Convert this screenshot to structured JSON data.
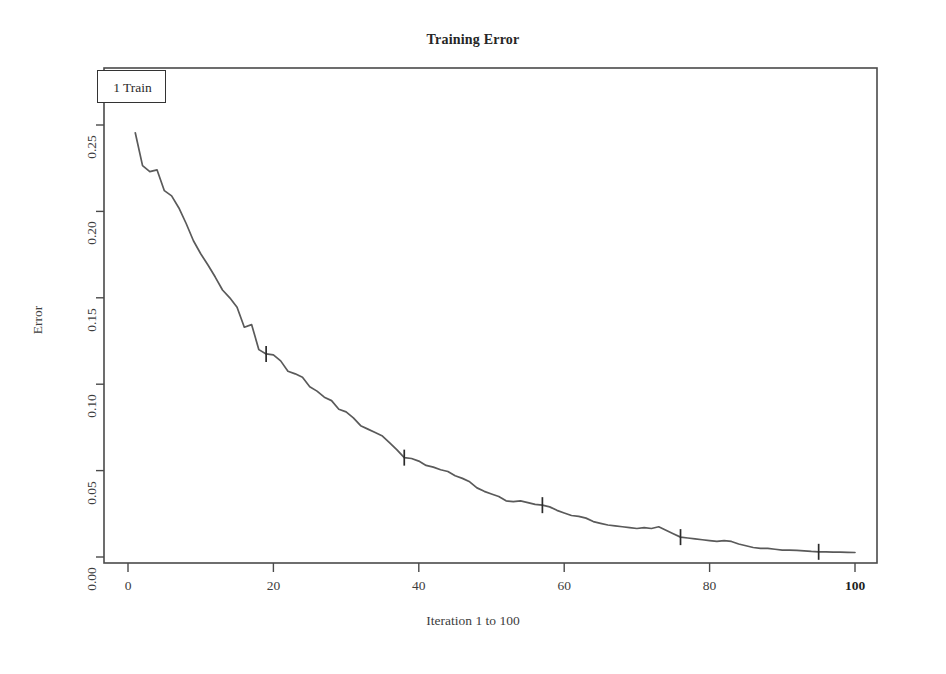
{
  "chart_data": {
    "type": "line",
    "title": "Training Error",
    "xlabel": "Iteration 1 to 100",
    "ylabel": "Error",
    "xlim": [
      0,
      100
    ],
    "ylim": [
      0.0,
      0.26
    ],
    "grid": false,
    "legend_position": "top-left",
    "legend": [
      "1 Train"
    ],
    "xticks": [
      0,
      20,
      40,
      60,
      80,
      100
    ],
    "xtick_labels": [
      "0",
      "20",
      "40",
      "60",
      "80",
      "100"
    ],
    "yticks": [
      0.0,
      0.05,
      0.1,
      0.15,
      0.2,
      0.25
    ],
    "ytick_labels": [
      "0.00",
      "0.05",
      "0.10",
      "0.15",
      "0.20",
      "0.25"
    ],
    "line_color": "#5a5a5a",
    "series": [
      {
        "name": "1 Train",
        "marker_iterations": [
          19,
          38,
          57,
          76,
          95
        ],
        "x": [
          1,
          2,
          3,
          4,
          5,
          6,
          7,
          8,
          9,
          10,
          11,
          12,
          13,
          14,
          15,
          16,
          17,
          18,
          19,
          20,
          21,
          22,
          23,
          24,
          25,
          26,
          27,
          28,
          29,
          30,
          31,
          32,
          33,
          34,
          35,
          36,
          37,
          38,
          39,
          40,
          41,
          42,
          43,
          44,
          45,
          46,
          47,
          48,
          49,
          50,
          51,
          52,
          53,
          54,
          55,
          56,
          57,
          58,
          59,
          60,
          61,
          62,
          63,
          64,
          65,
          66,
          67,
          68,
          69,
          70,
          71,
          72,
          73,
          74,
          75,
          76,
          77,
          78,
          79,
          80,
          81,
          82,
          83,
          84,
          85,
          86,
          87,
          88,
          89,
          90,
          91,
          92,
          93,
          94,
          95,
          96,
          97,
          98,
          99,
          100
        ],
        "values": [
          0.2455,
          0.2265,
          0.223,
          0.224,
          0.212,
          0.209,
          0.202,
          0.193,
          0.183,
          0.1755,
          0.169,
          0.162,
          0.1545,
          0.15,
          0.1445,
          0.133,
          0.1345,
          0.12,
          0.1175,
          0.117,
          0.1135,
          0.1075,
          0.106,
          0.104,
          0.0985,
          0.096,
          0.0925,
          0.0905,
          0.0855,
          0.084,
          0.0805,
          0.076,
          0.074,
          0.072,
          0.07,
          0.066,
          0.062,
          0.0575,
          0.057,
          0.0555,
          0.053,
          0.052,
          0.0505,
          0.0495,
          0.047,
          0.0455,
          0.0435,
          0.04,
          0.038,
          0.0365,
          0.035,
          0.0325,
          0.032,
          0.0325,
          0.0315,
          0.0305,
          0.03,
          0.029,
          0.027,
          0.0255,
          0.024,
          0.0235,
          0.0225,
          0.0205,
          0.0195,
          0.0185,
          0.018,
          0.0175,
          0.017,
          0.0165,
          0.017,
          0.0165,
          0.0175,
          0.0155,
          0.0135,
          0.0115,
          0.011,
          0.0105,
          0.01,
          0.0095,
          0.009,
          0.0095,
          0.009,
          0.0075,
          0.0065,
          0.0055,
          0.005,
          0.005,
          0.0045,
          0.004,
          0.004,
          0.0038,
          0.0035,
          0.0032,
          0.003,
          0.003,
          0.0028,
          0.0028,
          0.0027,
          0.0026
        ]
      }
    ]
  }
}
